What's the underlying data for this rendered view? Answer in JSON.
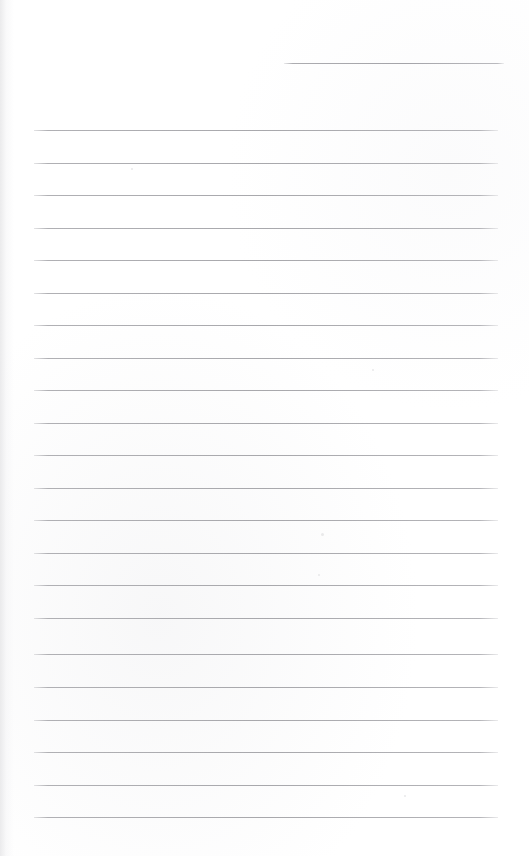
{
  "document": {
    "type": "lined-notebook-page",
    "title": "Blank ruled notebook page",
    "page_width": 529,
    "page_height": 856,
    "background_color": "#ffffff",
    "rule_color": "#a8a8ac",
    "rule_thickness": 1,
    "content_text": "",
    "has_handwriting": false,
    "has_margin_rule": false
  },
  "rules": {
    "left_x": 34,
    "right_x": 498,
    "spacing": 32.3,
    "count_full_width": 22,
    "short_rule": {
      "left_x": 284,
      "right_x": 504,
      "y": 63
    },
    "lines": [
      {
        "y": 63,
        "x1": 284,
        "x2": 504,
        "variant": "short"
      },
      {
        "y": 130,
        "x1": 34,
        "x2": 498,
        "variant": "full"
      },
      {
        "y": 163,
        "x1": 34,
        "x2": 498,
        "variant": "full"
      },
      {
        "y": 195,
        "x1": 34,
        "x2": 498,
        "variant": "full"
      },
      {
        "y": 228,
        "x1": 34,
        "x2": 498,
        "variant": "full"
      },
      {
        "y": 260,
        "x1": 34,
        "x2": 498,
        "variant": "full"
      },
      {
        "y": 293,
        "x1": 34,
        "x2": 498,
        "variant": "full"
      },
      {
        "y": 325,
        "x1": 34,
        "x2": 498,
        "variant": "full"
      },
      {
        "y": 358,
        "x1": 34,
        "x2": 498,
        "variant": "full"
      },
      {
        "y": 390,
        "x1": 34,
        "x2": 498,
        "variant": "full"
      },
      {
        "y": 423,
        "x1": 34,
        "x2": 498,
        "variant": "full"
      },
      {
        "y": 455,
        "x1": 34,
        "x2": 498,
        "variant": "full"
      },
      {
        "y": 488,
        "x1": 34,
        "x2": 498,
        "variant": "full"
      },
      {
        "y": 520,
        "x1": 34,
        "x2": 498,
        "variant": "full"
      },
      {
        "y": 553,
        "x1": 34,
        "x2": 498,
        "variant": "full"
      },
      {
        "y": 585,
        "x1": 34,
        "x2": 498,
        "variant": "full"
      },
      {
        "y": 618,
        "x1": 34,
        "x2": 498,
        "variant": "full"
      },
      {
        "y": 654,
        "x1": 34,
        "x2": 498,
        "variant": "full"
      },
      {
        "y": 687,
        "x1": 34,
        "x2": 498,
        "variant": "full"
      },
      {
        "y": 720,
        "x1": 34,
        "x2": 498,
        "variant": "full"
      },
      {
        "y": 752,
        "x1": 34,
        "x2": 498,
        "variant": "full"
      },
      {
        "y": 785,
        "x1": 34,
        "x2": 498,
        "variant": "full"
      },
      {
        "y": 817,
        "x1": 34,
        "x2": 498,
        "variant": "full"
      }
    ]
  },
  "specks": [
    {
      "x": 321,
      "y": 533,
      "size": 3
    },
    {
      "x": 318,
      "y": 574,
      "size": 2
    },
    {
      "x": 131,
      "y": 168,
      "size": 2
    },
    {
      "x": 404,
      "y": 795,
      "size": 2
    },
    {
      "x": 372,
      "y": 369,
      "size": 2
    }
  ]
}
